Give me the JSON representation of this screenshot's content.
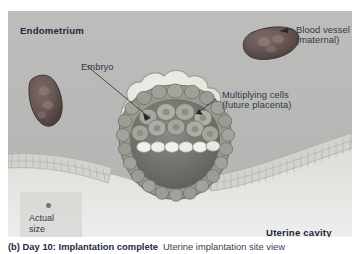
{
  "figure": {
    "labels": {
      "endometrium": "Endometrium",
      "uterine_cavity": "Uterine cavity",
      "blood_vessel_line1": "Blood vessel",
      "blood_vessel_line2": "(maternal)",
      "embryo": "Embryo",
      "multiplying_line1": "Multiplying cells",
      "multiplying_line2": "(future placenta)"
    },
    "actual_size": {
      "line1": "Actual",
      "line2": "size",
      "dot_color": "#6e7480"
    },
    "caption": {
      "bold": "(b) Day 10: Implantation complete",
      "rest": "Uterine implantation site view"
    },
    "colors": {
      "endometrium_bg": "#b9b9b7",
      "uterine_cavity_bg": "#e4e4e2",
      "blood_vessel": "#6b5a57",
      "blood_vessel_dark": "#4f4340",
      "trophoblast": "#8e8d86",
      "syncytium": "#e9e8e3",
      "blastocyst_cavity": "#6f6d68",
      "epithelium": "#cfcfca",
      "label_text": "#2f3848",
      "heading_text": "#1d2a3d",
      "leader_line": "#3b3b3b"
    }
  }
}
